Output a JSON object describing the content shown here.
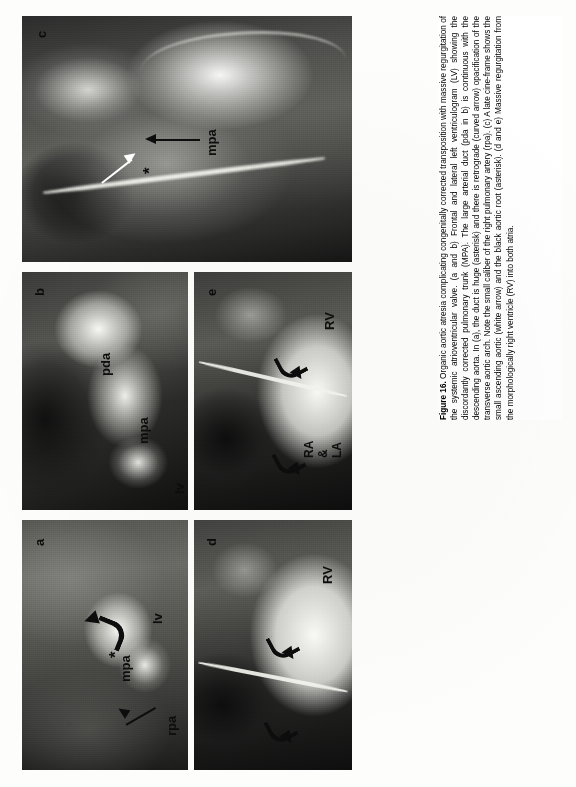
{
  "figure": {
    "label": "Figure 16.",
    "caption_lead": "Organic aortic atresia complicating congenitally corrected transposition with massive regurgitation of the systemic atrioventricular valve.",
    "caption_body": "(a and b) Frontal and lateral left ventriculogram (LV) showing the discordantly corrected pulmonary trunk (MPA). The large arterial duct (pda in b) is continuous with the descending aorta. In (a), the duct is huge (asterisk) and there is retrograde (curved arrow) opacification of the transverse aortic arch. Note the small caliber of the right pulmonary artery (rpa). (c) A late cine-frame shows the small ascending aortic (white arrow) and the black aortic root (asterisk). (d and e) Massive regurgitation from the morphologically right ventricle (RV) into both atria.",
    "caption_full": "Figure 16. Organic aortic atresia complicating congenitally corrected transposition with massive regurgitation of the systemic atrioventricular valve. (a and b) Frontal and lateral left ventriculogram (LV) showing the discordantly corrected pulmonary trunk (MPA). The large arterial duct (pda in b) is continuous with the descending aorta. In (a), the duct is huge (asterisk) and there is retrograde (curved arrow) opacification of the transverse aortic arch. Note the small caliber of the right pulmonary artery (rpa). (c) A late cine-frame shows the small ascending aortic (white arrow) and the black aortic root (asterisk). (d and e) Massive regurgitation from the morphologically right ventricle (RV) into both atria."
  },
  "panels": [
    {
      "id": "a",
      "letter": "a",
      "modality": "angiogram",
      "annotations": [
        {
          "name": "mpa-label",
          "text": "mpa"
        },
        {
          "name": "rpa-label",
          "text": "rpa"
        },
        {
          "name": "lv-label",
          "text": "lv"
        },
        {
          "name": "asterisk-marker",
          "text": "*"
        },
        {
          "name": "curved-arrow",
          "text": ""
        },
        {
          "name": "rpa-pointer-arrow",
          "text": ""
        }
      ]
    },
    {
      "id": "b",
      "letter": "b",
      "modality": "angiogram",
      "annotations": [
        {
          "name": "pda-label",
          "text": "pda"
        },
        {
          "name": "mpa-label",
          "text": "mpa"
        },
        {
          "name": "lv-label",
          "text": "lv"
        }
      ]
    },
    {
      "id": "c",
      "letter": "c",
      "modality": "cine-frame",
      "annotations": [
        {
          "name": "mpa-label",
          "text": "mpa"
        },
        {
          "name": "asterisk-marker",
          "text": "*"
        },
        {
          "name": "white-arrow",
          "text": ""
        },
        {
          "name": "mpa-pointer-arrow",
          "text": ""
        }
      ]
    },
    {
      "id": "d",
      "letter": "d",
      "modality": "angiogram",
      "annotations": [
        {
          "name": "rv-label",
          "text": "RV"
        },
        {
          "name": "curved-arrow-left",
          "text": ""
        },
        {
          "name": "curved-arrow-right",
          "text": ""
        }
      ]
    },
    {
      "id": "e",
      "letter": "e",
      "modality": "angiogram",
      "annotations": [
        {
          "name": "rv-label",
          "text": "RV"
        },
        {
          "name": "ra-label",
          "text": "RA"
        },
        {
          "name": "amp-label",
          "text": "&"
        },
        {
          "name": "la-label",
          "text": "LA"
        },
        {
          "name": "curved-arrow-left",
          "text": ""
        },
        {
          "name": "curved-arrow-right",
          "text": ""
        }
      ]
    }
  ],
  "colors": {
    "page_background": "#fdfdfc",
    "film_black": "#0a0a0a",
    "annotation_black": "#0d0d0d",
    "annotation_white": "#ffffff",
    "caption_text": "#000000"
  }
}
